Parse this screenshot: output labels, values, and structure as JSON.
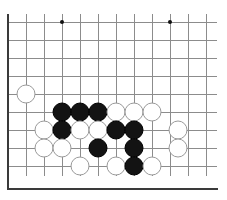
{
  "board": {
    "title": "Go board position",
    "game": "Go",
    "grid": {
      "origin_x": 8,
      "origin_y": 22,
      "spacing": 18,
      "cols": 12,
      "rows": 9,
      "line_color": "#8c8c8c",
      "border_color": "#3a3a3a",
      "background_color": "#ffffff"
    },
    "border": {
      "left_x": 8,
      "bottom_y": 188,
      "top_y": 14,
      "right_x": 219
    },
    "star_points": [
      {
        "x": 62,
        "y": 22,
        "label": "star-point-1"
      },
      {
        "x": 170,
        "y": 22,
        "label": "star-point-2"
      }
    ],
    "stone_colors": {
      "black": "#131313",
      "white": "#ffffff",
      "white_outline": "#9a9a9a"
    },
    "stones": [
      {
        "color": "white",
        "x": 26,
        "y": 94,
        "name": "stone-white-a"
      },
      {
        "color": "black",
        "x": 62,
        "y": 112,
        "name": "stone-black-b1"
      },
      {
        "color": "black",
        "x": 80,
        "y": 112,
        "name": "stone-black-b2"
      },
      {
        "color": "black",
        "x": 98,
        "y": 112,
        "name": "stone-black-b3"
      },
      {
        "color": "white",
        "x": 116,
        "y": 112,
        "name": "stone-white-b4"
      },
      {
        "color": "white",
        "x": 134,
        "y": 112,
        "name": "stone-white-b5"
      },
      {
        "color": "white",
        "x": 152,
        "y": 112,
        "name": "stone-white-b6"
      },
      {
        "color": "white",
        "x": 44,
        "y": 130,
        "name": "stone-white-c0"
      },
      {
        "color": "black",
        "x": 62,
        "y": 130,
        "name": "stone-black-c1"
      },
      {
        "color": "white",
        "x": 80,
        "y": 130,
        "name": "stone-white-c2"
      },
      {
        "color": "white",
        "x": 98,
        "y": 130,
        "name": "stone-white-c3"
      },
      {
        "color": "black",
        "x": 116,
        "y": 130,
        "name": "stone-black-c4"
      },
      {
        "color": "black",
        "x": 134,
        "y": 130,
        "name": "stone-black-c5"
      },
      {
        "color": "white",
        "x": 178,
        "y": 130,
        "name": "stone-white-c7"
      },
      {
        "color": "white",
        "x": 44,
        "y": 148,
        "name": "stone-white-d0"
      },
      {
        "color": "white",
        "x": 62,
        "y": 148,
        "name": "stone-white-d1"
      },
      {
        "color": "black",
        "x": 98,
        "y": 148,
        "name": "stone-black-d3"
      },
      {
        "color": "black",
        "x": 134,
        "y": 148,
        "name": "stone-black-d5"
      },
      {
        "color": "white",
        "x": 178,
        "y": 148,
        "name": "stone-white-d7"
      },
      {
        "color": "white",
        "x": 80,
        "y": 166,
        "name": "stone-white-e2"
      },
      {
        "color": "white",
        "x": 116,
        "y": 166,
        "name": "stone-white-e4"
      },
      {
        "color": "black",
        "x": 134,
        "y": 166,
        "name": "stone-black-e5"
      },
      {
        "color": "white",
        "x": 152,
        "y": 166,
        "name": "stone-white-e6"
      }
    ]
  }
}
